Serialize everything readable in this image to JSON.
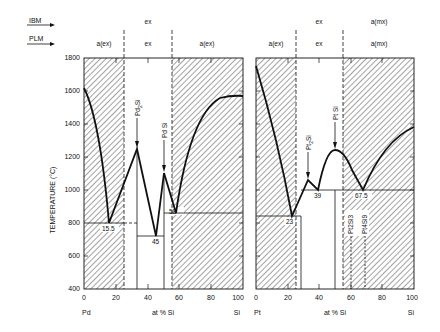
{
  "legend": {
    "ibm_label": "IBM",
    "plm_label": "PLM"
  },
  "y_axis": {
    "label": "TEMPERATURE (°C)",
    "ticks": [
      "1800",
      "1600",
      "1400",
      "1200",
      "1000",
      "800",
      "600",
      "400"
    ]
  },
  "left_panel": {
    "x_ticks": [
      "0",
      "20",
      "40",
      "60",
      "80",
      "100"
    ],
    "x_label": "at % Si",
    "left_element": "Pd",
    "right_element": "Si",
    "ibm_regions": [
      "ex"
    ],
    "plm_regions": [
      "a(ex)",
      "ex",
      "a(ex)"
    ],
    "compounds": [
      {
        "name": "Pd2Si",
        "label_main": "Pd",
        "sub": "2",
        "label_end": "Si"
      },
      {
        "name": "Pd Si",
        "label_main": "Pd Si"
      }
    ],
    "eutectics": [
      "15.5",
      "45",
      "58"
    ]
  },
  "right_panel": {
    "x_ticks": [
      "0",
      "20",
      "40",
      "60",
      "80",
      "100"
    ],
    "x_label": "at % Si",
    "left_element": "Pt",
    "right_element": "Si",
    "ibm_regions": [
      "ex",
      "a(mx)"
    ],
    "plm_regions": [
      "a(ex)",
      "ex",
      "a(mx)"
    ],
    "compounds": [
      {
        "name": "Pt2Si",
        "label_main": "Pt",
        "sub": "2",
        "label_end": "Si"
      },
      {
        "name": "Pt Si",
        "label_main": "Pt Si"
      },
      {
        "name": "Pt2Si3",
        "label": "Pt2Si3"
      },
      {
        "name": "Pt4Si9",
        "label": "Pt4Si9"
      }
    ],
    "eutectics": [
      "23",
      "39",
      "67.5"
    ]
  }
}
